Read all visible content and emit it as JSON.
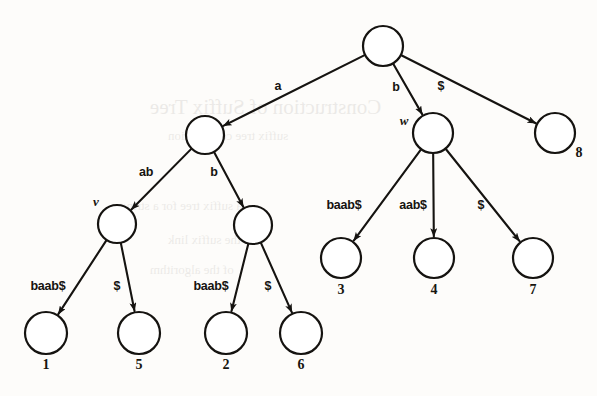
{
  "figure": {
    "ink_color": "#151310",
    "paper_color": "#fdfcfa",
    "width": 597,
    "height": 396
  },
  "background_bleed": [
    {
      "text": "Construction of Suffix Tree",
      "x": 150,
      "y": 95,
      "size": 21
    },
    {
      "text": "suffix tree construction",
      "x": 168,
      "y": 128,
      "size": 13
    },
    {
      "text": "a suffix tree for a string",
      "x": 120,
      "y": 198,
      "size": 13
    },
    {
      "text": "is the suffix link",
      "x": 168,
      "y": 232,
      "size": 13
    },
    {
      "text": "of the algorithm",
      "x": 150,
      "y": 262,
      "size": 13
    }
  ],
  "nodes": [
    {
      "id": "root",
      "x": 383,
      "y": 46,
      "r": 20,
      "label": "",
      "name": "",
      "name_x": 0,
      "name_y": 0
    },
    {
      "id": "n_a",
      "x": 205,
      "y": 135,
      "r": 19,
      "label": "",
      "name": "",
      "name_x": 0,
      "name_y": 0
    },
    {
      "id": "w",
      "x": 433,
      "y": 133,
      "r": 20,
      "label": "",
      "name": "w",
      "name_x": 404,
      "name_y": 121
    },
    {
      "id": "leaf8",
      "x": 555,
      "y": 133,
      "r": 20,
      "label": "8",
      "name": "",
      "name_x": 0,
      "name_y": 0
    },
    {
      "id": "v",
      "x": 117,
      "y": 224,
      "r": 19,
      "label": "",
      "name": "v",
      "name_x": 96,
      "name_y": 202
    },
    {
      "id": "n_ab",
      "x": 253,
      "y": 225,
      "r": 19,
      "label": "",
      "name": "",
      "name_x": 0,
      "name_y": 0
    },
    {
      "id": "leaf3",
      "x": 341,
      "y": 258,
      "r": 20,
      "label": "3",
      "name": "",
      "name_x": 0,
      "name_y": 0
    },
    {
      "id": "leaf4",
      "x": 434,
      "y": 258,
      "r": 20,
      "label": "4",
      "name": "",
      "name_x": 0,
      "name_y": 0
    },
    {
      "id": "leaf7",
      "x": 533,
      "y": 258,
      "r": 20,
      "label": "7",
      "name": "",
      "name_x": 0,
      "name_y": 0
    },
    {
      "id": "leaf1",
      "x": 46,
      "y": 333,
      "r": 21,
      "label": "1",
      "name": "",
      "name_x": 0,
      "name_y": 0
    },
    {
      "id": "leaf5",
      "x": 139,
      "y": 333,
      "r": 21,
      "label": "5",
      "name": "",
      "name_x": 0,
      "name_y": 0
    },
    {
      "id": "leaf2",
      "x": 226,
      "y": 333,
      "r": 21,
      "label": "2",
      "name": "",
      "name_x": 0,
      "name_y": 0
    },
    {
      "id": "leaf6",
      "x": 301,
      "y": 333,
      "r": 21,
      "label": "6",
      "name": "",
      "name_x": 0,
      "name_y": 0
    }
  ],
  "node_label_offsets": {
    "leaf8": {
      "dx": 24,
      "dy": 20
    },
    "leaf_below": {
      "dx": 0,
      "dy": 32
    }
  },
  "edges": [
    {
      "from": "root",
      "to": "n_a",
      "label": "a",
      "label_x": 278,
      "label_y": 86,
      "arrow": true
    },
    {
      "from": "root",
      "to": "w",
      "label": "b",
      "label_x": 396,
      "label_y": 87,
      "arrow": true
    },
    {
      "from": "root",
      "to": "leaf8",
      "label": "$",
      "label_x": 441,
      "label_y": 86,
      "arrow": true
    },
    {
      "from": "n_a",
      "to": "v",
      "label": "ab",
      "label_x": 146,
      "label_y": 172,
      "arrow": true
    },
    {
      "from": "n_a",
      "to": "n_ab",
      "label": "b",
      "label_x": 214,
      "label_y": 172,
      "arrow": true
    },
    {
      "from": "w",
      "to": "leaf3",
      "label": "baab$",
      "label_x": 344,
      "label_y": 205,
      "arrow": true
    },
    {
      "from": "w",
      "to": "leaf4",
      "label": "aab$",
      "label_x": 413,
      "label_y": 205,
      "arrow": true
    },
    {
      "from": "w",
      "to": "leaf7",
      "label": "$",
      "label_x": 481,
      "label_y": 205,
      "arrow": true
    },
    {
      "from": "v",
      "to": "leaf1",
      "label": "baab$",
      "label_x": 48,
      "label_y": 286,
      "arrow": true
    },
    {
      "from": "v",
      "to": "leaf5",
      "label": "$",
      "label_x": 117,
      "label_y": 286,
      "arrow": true
    },
    {
      "from": "n_ab",
      "to": "leaf2",
      "label": "baab$",
      "label_x": 211,
      "label_y": 286,
      "arrow": true
    },
    {
      "from": "n_ab",
      "to": "leaf6",
      "label": "$",
      "label_x": 268,
      "label_y": 286,
      "arrow": true
    }
  ],
  "legend": {
    "string": "abaab$",
    "description": "Suffix tree with internal nodes v and w and leaves numbered 1 through 8"
  }
}
